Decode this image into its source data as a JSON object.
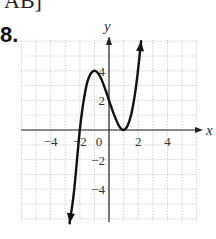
{
  "header": {
    "top_fragment": "AB]",
    "problem_number": "8."
  },
  "chart_data": {
    "type": "line",
    "title": "",
    "xlabel": "x",
    "ylabel": "y",
    "xlim": [
      -6,
      6
    ],
    "ylim": [
      -6,
      6
    ],
    "grid": true,
    "grid_style": "dotted",
    "x_ticks": [
      -4,
      -2,
      0,
      2,
      4
    ],
    "x_tick_labels": [
      "−4",
      "−2",
      "0",
      "2",
      "4"
    ],
    "y_ticks": [
      4,
      2,
      -2,
      -4
    ],
    "y_tick_labels": [
      "4",
      "2",
      "−2",
      "−4"
    ],
    "series": [
      {
        "name": "f(x)",
        "description": "cubic curve with local max at (-1, 4), local min at (1, 0), x-intercept at -2; arrows at both ends",
        "points": [
          [
            -2.7,
            -6.3
          ],
          [
            -2.4,
            -4.2
          ],
          [
            -2.0,
            0.0
          ],
          [
            -1.7,
            2.2
          ],
          [
            -1.4,
            3.5
          ],
          [
            -1.0,
            4.0
          ],
          [
            -0.6,
            3.6
          ],
          [
            -0.2,
            2.6
          ],
          [
            0.0,
            2.0
          ],
          [
            0.4,
            0.9
          ],
          [
            0.7,
            0.25
          ],
          [
            1.0,
            0.0
          ],
          [
            1.3,
            0.35
          ],
          [
            1.6,
            1.4
          ],
          [
            1.9,
            3.3
          ],
          [
            2.2,
            6.0
          ]
        ],
        "key_points": {
          "local_max": [
            -1,
            4
          ],
          "local_min": [
            1,
            0
          ],
          "x_intercepts": [
            -2,
            1
          ],
          "y_intercept": [
            0,
            2
          ]
        },
        "end_arrows": true
      }
    ],
    "colors": {
      "curve": "#111111",
      "axes": "#222222",
      "grid": "#bdbdbd"
    }
  }
}
